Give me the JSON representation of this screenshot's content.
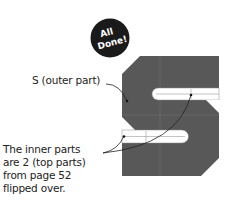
{
  "badge": {
    "line1": "All",
    "line2": "Done!",
    "color": "#1a1a1a",
    "text_color": "#ffffff"
  },
  "labels": {
    "outer_part": "S (outer part)",
    "inner_parts": [
      "The inner parts",
      "are 2 (top parts)",
      "from page 52",
      "flipped over."
    ]
  },
  "shape": {
    "name": "S",
    "fill_color": "#585858",
    "guide_line_color": "#7a7a7a",
    "bar_color": "#ffffff"
  }
}
